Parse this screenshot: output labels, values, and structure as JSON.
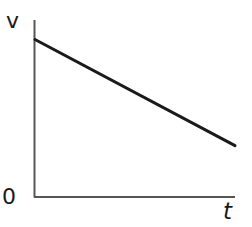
{
  "chart_data": {
    "type": "line",
    "title": "",
    "xlabel": "t",
    "ylabel": "v",
    "origin_label": "0",
    "series": [
      {
        "name": "v(t)",
        "x": [
          0,
          1
        ],
        "values": [
          0.89,
          0.29
        ],
        "color": "#1a1a1a"
      }
    ],
    "xlim": [
      0,
      1
    ],
    "ylim": [
      0,
      1
    ],
    "grid": false,
    "legend": null
  },
  "axes": {
    "x_label": "t",
    "y_label": "v",
    "origin": "0",
    "axis_color": "#555555",
    "line_color": "#1a1a1a"
  }
}
